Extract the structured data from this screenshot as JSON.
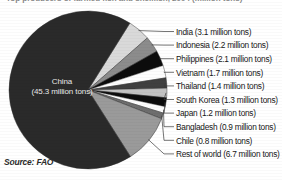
{
  "title": "Top producers of farmed fish and shellfish, 2004 (million tons)",
  "source": "Source: FAO",
  "center": {
    "line1": "China",
    "line2": "(45.3 million tons)"
  },
  "legend": [
    {
      "label": "India (3.1 million tons)",
      "color": "#d9d9d9"
    },
    {
      "label": "Indonesia (2.2 million tons)",
      "color": "#8c8c8c"
    },
    {
      "label": "Philippines (2.1 million tons)",
      "color": "#0c0c0c"
    },
    {
      "label": "Vietnam (1.7 million tons)",
      "color": "#fdfdfd"
    },
    {
      "label": "Thailand (1.4 million tons)",
      "color": "#3f3f3f"
    },
    {
      "label": "South Korea (1.3 million tons)",
      "color": "#c2c2c2"
    },
    {
      "label": "Japan (1.2 million tons)",
      "color": "#0c0c0c"
    },
    {
      "label": "Bangladesh (0.9 million tons)",
      "color": "#fdfdfd"
    },
    {
      "label": "Chile (0.8 million tons)",
      "color": "#6e6e6e"
    },
    {
      "label": "Rest of world (6.7 million tons)",
      "color": "#9a9a9a"
    }
  ],
  "chart_data": {
    "type": "pie",
    "unit": "million tons",
    "legend_position": "right",
    "grid": false,
    "total": 66.7,
    "categories": [
      "China",
      "India",
      "Indonesia",
      "Philippines",
      "Vietnam",
      "Thailand",
      "South Korea",
      "Japan",
      "Bangladesh",
      "Chile",
      "Rest of world"
    ],
    "values": [
      45.3,
      3.1,
      2.2,
      2.1,
      1.7,
      1.4,
      1.3,
      1.2,
      0.9,
      0.8,
      6.7
    ],
    "colors": [
      "#2a2a2a",
      "#d9d9d9",
      "#8c8c8c",
      "#0c0c0c",
      "#fdfdfd",
      "#3f3f3f",
      "#c2c2c2",
      "#0c0c0c",
      "#fdfdfd",
      "#6e6e6e",
      "#9a9a9a"
    ],
    "annotations": [
      "China (45.3 million tons)",
      "Source: FAO"
    ]
  }
}
